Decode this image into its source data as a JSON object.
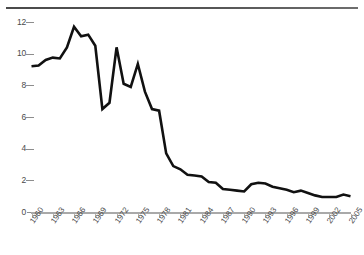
{
  "chart_data": {
    "type": "line",
    "title": "",
    "subtitle": "",
    "xlabel": "",
    "ylabel": "",
    "xlim": [
      1960,
      2005
    ],
    "ylim": [
      0,
      12
    ],
    "grid": false,
    "legend": false,
    "legend_position": "none",
    "line_color": "#111111",
    "axis_color": "#a9a9a9",
    "label_color": "#4a4a4a",
    "y_ticks": [
      0,
      2,
      4,
      6,
      8,
      10,
      12
    ],
    "y_tick_labels": [
      "0",
      "2",
      "4",
      "6",
      "8",
      "10",
      "12"
    ],
    "x_tick_labels": [
      "1960",
      "1963",
      "1966",
      "1969",
      "1972",
      "1975",
      "1978",
      "1981",
      "1984",
      "1987",
      "1990",
      "1993",
      "1996",
      "1999",
      "2002",
      "2005"
    ],
    "x_tick_values": [
      1960,
      1963,
      1966,
      1969,
      1972,
      1975,
      1978,
      1981,
      1984,
      1987,
      1990,
      1993,
      1996,
      1999,
      2002,
      2005
    ],
    "series": [
      {
        "name": "value",
        "x": [
          1960,
          1961,
          1962,
          1963,
          1964,
          1965,
          1966,
          1967,
          1968,
          1969,
          1970,
          1971,
          1972,
          1973,
          1974,
          1975,
          1976,
          1977,
          1978,
          1979,
          1980,
          1981,
          1982,
          1983,
          1984,
          1985,
          1986,
          1987,
          1988,
          1989,
          1990,
          1991,
          1992,
          1993,
          1994,
          1995,
          1996,
          1997,
          1998,
          1999,
          2000,
          2001,
          2002,
          2003,
          2004,
          2005
        ],
        "values": [
          9.2,
          9.25,
          9.6,
          9.75,
          9.7,
          10.4,
          11.7,
          11.1,
          11.2,
          10.5,
          6.5,
          6.9,
          10.4,
          8.1,
          7.9,
          9.35,
          7.6,
          6.5,
          6.4,
          3.7,
          2.9,
          2.7,
          2.35,
          2.3,
          2.25,
          1.9,
          1.85,
          1.45,
          1.4,
          1.35,
          1.3,
          1.75,
          1.85,
          1.8,
          1.6,
          1.5,
          1.4,
          1.25,
          1.35,
          1.2,
          1.05,
          0.95,
          0.95,
          0.95,
          1.1,
          1.0
        ]
      }
    ]
  },
  "figure": {
    "top_rule": "horizontal-rule"
  }
}
